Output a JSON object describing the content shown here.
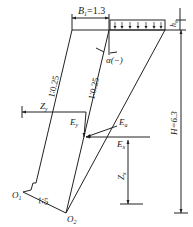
{
  "diagram": {
    "type": "retaining-wall-earth-pressure",
    "labels": {
      "b1": "B",
      "b1_sub": "1",
      "b1_value": "=1.3",
      "h0": "h",
      "h0_sub": "0",
      "alpha": "α(−)",
      "slope_front": "1∶0.25",
      "slope_back": "1∶0.25",
      "zy": "Z",
      "zy_sub": "y",
      "ey": "E",
      "ey_sub": "y",
      "ea": "E",
      "ea_sub": "a",
      "ex": "E",
      "ex_sub": "x",
      "zx": "Z",
      "zx_sub": "x",
      "height": "H=6.3",
      "o1": "O",
      "o1_sub": "1",
      "o2": "O",
      "o2_sub": "2",
      "base_slope": "1∶5"
    },
    "colors": {
      "line": "#222222",
      "background": "#ffffff"
    }
  }
}
